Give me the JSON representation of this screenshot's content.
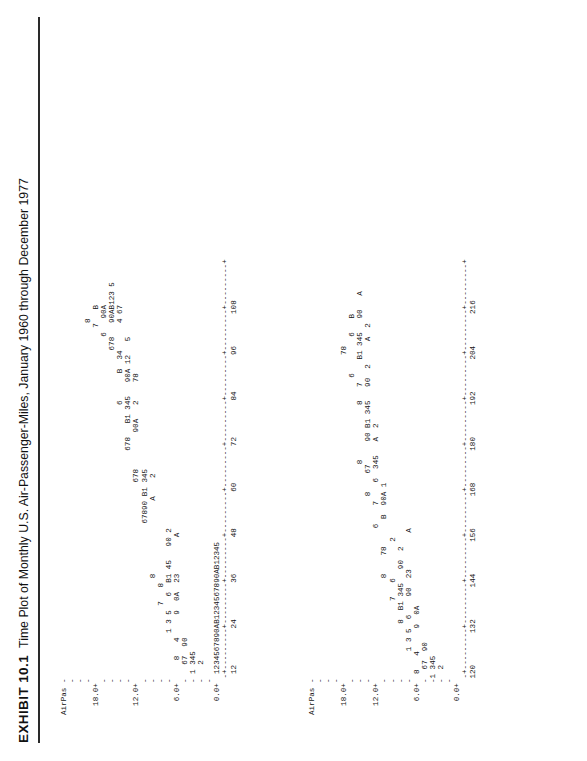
{
  "exhibit": {
    "number": "EXHIBIT 10.1",
    "title": "Time Plot of Monthly U.S. Air-Passenger-Miles, January 1960 through December 1977"
  },
  "panels": [
    {
      "name": "upper-panel",
      "y_axis_label": "AirPas",
      "y_ticks": [
        "18.0+",
        "12.0+",
        "6.0+",
        "0.0+"
      ],
      "x_ticks": [
        "12",
        "24",
        "36",
        "48",
        "60",
        "72",
        "84",
        "96",
        "108"
      ],
      "x_range": [
        0,
        108
      ],
      "rows": [
        "AirPas -",
        "       -",
        "       -                                                           8",
        "       -                                                          7   B",
        "  18.0+",
        "       -",
        "       -",
        "       -",
        "       -",
        "  12.0+",
        "       -",
        "       -",
        "       -",
        "       -",
        "   6.0+",
        "       -",
        "       -",
        "       -",
        "       -",
        "   0.0+",
        "        --+---------+---------+---------+---------+---------+---------+---------+---------+---------+--",
        "          12        24        36        48        60        72        84        96       108"
      ]
    },
    {
      "name": "lower-panel",
      "y_axis_label": "AirPas",
      "y_ticks": [
        "18.0+",
        "12.0+",
        "6.0+",
        "0.0+"
      ],
      "x_ticks": [
        "120",
        "132",
        "144",
        "156",
        "168",
        "180",
        "192",
        "204",
        "216"
      ],
      "x_range": [
        109,
        216
      ]
    }
  ],
  "plot_top_text": [
    "AirPas -",
    "       -",
    "       -",
    "       -                                                                              8",
    "  18.0+                                                                              7   B",
    "       -                                                                           6   90A",
    "       -                                                                        678   90AB123 5",
    "       -                                                            6      B  34      4 67",
    "       -                                                  678   B1 345   90A 12   5",
    "  12.0+                                            678        90A   2    78",
    "       -                                  67890 B1 345",
    "       -                      8                A    2",
    "       -                7   8",
    "       -          1 3 5   6  B1 45   90 2",
    "   6.0+     8   4     9  0A  23        A",
    "       -   67  90",
    "       - 1 345",
    "       -   2",
    "       -",
    "   0.0+  1234567890AB1234567890AB12345",
    "        -+---------+---------+---------+---------+---------+---------+---------+---------+---------+",
    "         12        24        36        48        60        72        84        96       108"
  ],
  "plot_bottom_text": [
    "AirPas -",
    "       -",
    "       -",
    "       -",
    "  18.0+                                                                        78",
    "       -                                                                  6        6   B",
    "       -                                               8            8   7     B1 345   90   A",
    "       -                                        8    67     90 B1 345   90  2     A  2",
    "  12.0+                                  6    7    6  345   A  2",
    "       -                      8    78      B  90A 1",
    "       -                 7   6        2",
    "       -            8  B1 345   90  2",
    "       -      1 3 5  6    90  23        A",
    "   6.0+  8   4     9  0A",
    "       -  67  90",
    "       -1 345",
    "       -  2",
    "       -",
    "   0.0+",
    "        -+---------+---------+---------+---------+---------+---------+---------+---------+---------+",
    "        120       132       144       156       168       180       192       204       216"
  ],
  "chart_data": {
    "type": "line",
    "title": "Time Plot of Monthly U.S. Air-Passenger-Miles, January 1960 through December 1977",
    "xlabel": "",
    "ylabel": "AirPas",
    "ylim": [
      0.0,
      18.0
    ],
    "plot_symbols": {
      "1": "January",
      "2": "February",
      "3": "March",
      "4": "April",
      "5": "May",
      "6": "June",
      "7": "July",
      "8": "August",
      "9": "September",
      "0": "October",
      "A": "November",
      "B": "December"
    },
    "panels": [
      {
        "name": "months 1-108",
        "xlim": [
          0,
          108
        ],
        "xticks": [
          12,
          24,
          36,
          48,
          60,
          72,
          84,
          96,
          108
        ],
        "yticks": [
          0.0,
          6.0,
          12.0,
          18.0
        ]
      },
      {
        "name": "months 109-216",
        "xlim": [
          108,
          216
        ],
        "xticks": [
          120,
          132,
          144,
          156,
          168,
          180,
          192,
          204,
          216
        ],
        "yticks": [
          0.0,
          6.0,
          12.0,
          18.0
        ]
      }
    ],
    "x": [
      1,
      2,
      3,
      4,
      5,
      6,
      7,
      8,
      9,
      10,
      11,
      12,
      13,
      14,
      15,
      16,
      17,
      18,
      19,
      20,
      21,
      22,
      23,
      24,
      25,
      26,
      27,
      28,
      29,
      30,
      31,
      32,
      33,
      34,
      35,
      36,
      37,
      38,
      39,
      40,
      41,
      42,
      43,
      44,
      45,
      46,
      47,
      48,
      49,
      50,
      51,
      52,
      53,
      54,
      55,
      56,
      57,
      58,
      59,
      60,
      61,
      62,
      63,
      64,
      65,
      66,
      67,
      68,
      69,
      70,
      71,
      72,
      73,
      74,
      75,
      76,
      77,
      78,
      79,
      80,
      81,
      82,
      83,
      84,
      85,
      86,
      87,
      88,
      89,
      90,
      91,
      92,
      93,
      94,
      95,
      96,
      97,
      98,
      99,
      100,
      101,
      102,
      103,
      104,
      105,
      106,
      107,
      108,
      109,
      110,
      111,
      112,
      113,
      114,
      115,
      116,
      117,
      118,
      119,
      120,
      121,
      122,
      123,
      124,
      125,
      126,
      127,
      128,
      129,
      130,
      131,
      132,
      133,
      134,
      135,
      136,
      137,
      138,
      139,
      140,
      141,
      142,
      143,
      144,
      145,
      146,
      147,
      148,
      149,
      150,
      151,
      152,
      153,
      154,
      155,
      156,
      157,
      158,
      159,
      160,
      161,
      162,
      163,
      164,
      165,
      166,
      167,
      168,
      169,
      170,
      171,
      172,
      173,
      174,
      175,
      176,
      177,
      178,
      179,
      180,
      181,
      182,
      183,
      184,
      185,
      186,
      187,
      188,
      189,
      190,
      191,
      192,
      193,
      194,
      195,
      196,
      197,
      198,
      199,
      200,
      201,
      202,
      203,
      204,
      205,
      206,
      207,
      208,
      209,
      210,
      211,
      212,
      213,
      214,
      215,
      216
    ],
    "y": [
      2.8,
      2.7,
      3.2,
      3.1,
      3.1,
      3.5,
      3.9,
      3.8,
      3.2,
      3.1,
      2.8,
      3.0,
      3.0,
      2.8,
      3.3,
      3.2,
      3.3,
      3.7,
      4.3,
      4.2,
      3.4,
      3.3,
      3.0,
      3.2,
      3.2,
      3.1,
      3.8,
      3.7,
      3.8,
      4.3,
      4.9,
      4.8,
      4.0,
      3.8,
      3.5,
      3.8,
      3.7,
      3.6,
      4.4,
      4.4,
      4.5,
      5.1,
      5.8,
      5.7,
      4.7,
      4.5,
      4.1,
      4.5,
      4.4,
      4.3,
      5.2,
      5.2,
      5.4,
      6.1,
      6.9,
      6.8,
      5.6,
      5.4,
      4.9,
      5.3,
      5.2,
      5.1,
      6.1,
      6.2,
      6.4,
      7.3,
      8.3,
      8.2,
      6.7,
      6.5,
      5.9,
      6.4,
      6.4,
      6.2,
      7.5,
      7.6,
      7.9,
      9.0,
      10.2,
      10.1,
      8.2,
      8.0,
      7.2,
      7.9,
      7.5,
      7.3,
      8.8,
      8.9,
      9.3,
      10.6,
      12.0,
      11.9,
      9.7,
      9.4,
      8.5,
      9.3,
      8.8,
      8.6,
      10.3,
      10.5,
      11.0,
      12.5,
      14.2,
      14.0,
      11.4,
      11.1,
      10.0,
      11.0,
      9.8,
      9.5,
      11.5,
      11.7,
      12.3,
      13.9,
      15.8,
      15.6,
      12.7,
      12.4,
      11.2,
      12.3,
      10.4,
      10.1,
      12.2,
      12.4,
      13.0,
      14.8,
      16.8,
      16.6,
      13.5,
      13.2,
      11.9,
      13.1,
      10.8,
      10.5,
      12.7,
      12.9,
      13.6,
      15.4,
      17.5,
      17.3,
      14.1,
      13.7,
      12.4,
      13.6,
      11.0,
      10.7,
      12.9,
      13.2,
      13.8,
      15.7,
      17.8,
      17.6,
      14.3,
      13.9,
      12.6,
      13.9,
      11.2,
      10.9,
      13.2,
      13.4,
      14.1,
      16.0,
      18.2,
      18.0,
      14.6,
      14.2,
      12.9,
      14.2,
      11.4,
      11.1,
      13.4,
      13.7,
      14.4,
      16.3,
      18.5,
      18.3,
      14.9,
      14.5,
      13.1,
      14.4,
      11.6,
      11.3,
      13.6,
      13.9,
      14.6,
      16.6,
      18.8,
      18.6,
      15.1,
      14.7,
      13.3,
      14.7,
      11.8,
      11.5,
      13.9,
      14.1,
      14.9,
      16.9,
      19.2,
      19.0,
      15.4,
      15.0,
      13.6,
      15.0,
      12.0,
      11.7,
      14.1,
      14.4,
      15.1,
      17.2,
      19.5,
      19.3,
      15.7,
      15.3,
      13.8,
      15.2
    ]
  }
}
